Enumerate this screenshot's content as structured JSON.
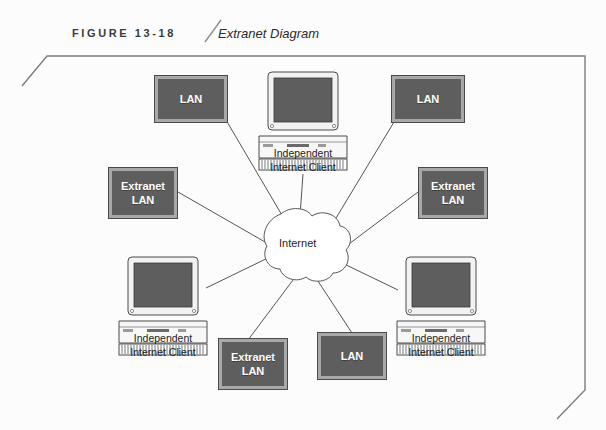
{
  "header": {
    "figure_label": "FIGURE 13-18",
    "title": "Extranet Diagram"
  },
  "diagram": {
    "center": {
      "name": "internet-cloud",
      "label": "Internet",
      "cx": 303,
      "cy": 243
    },
    "nodes": [
      {
        "id": "lan-top-left",
        "type": "lan-box",
        "label": "LAN",
        "lines": [
          "LAN"
        ],
        "x": 155,
        "y": 76,
        "w": 72,
        "h": 46
      },
      {
        "id": "client-top",
        "type": "computer",
        "label": "Independent Internet Client",
        "lines": [
          "Independent",
          "Internet Client"
        ],
        "x": 258,
        "y": 70,
        "w": 90,
        "h": 68
      },
      {
        "id": "lan-top-right",
        "type": "lan-box",
        "label": "LAN",
        "lines": [
          "LAN"
        ],
        "x": 392,
        "y": 76,
        "w": 72,
        "h": 46
      },
      {
        "id": "extranet-lan-left",
        "type": "lan-box",
        "label": "Extranet LAN",
        "lines": [
          "Extranet",
          "LAN"
        ],
        "x": 109,
        "y": 168,
        "w": 68,
        "h": 50
      },
      {
        "id": "extranet-lan-right",
        "type": "lan-box",
        "label": "Extranet LAN",
        "lines": [
          "Extranet",
          "LAN"
        ],
        "x": 419,
        "y": 168,
        "w": 68,
        "h": 50
      },
      {
        "id": "client-bottom-left",
        "type": "computer",
        "label": "Independent Internet Client",
        "lines": [
          "Independent",
          "Internet Client"
        ],
        "x": 118,
        "y": 255,
        "w": 90,
        "h": 68
      },
      {
        "id": "client-bottom-right",
        "type": "computer",
        "label": "Independent Internet Client",
        "lines": [
          "Independent",
          "Internet Client"
        ],
        "x": 396,
        "y": 255,
        "w": 90,
        "h": 68
      },
      {
        "id": "extranet-lan-bottom",
        "type": "lan-box",
        "label": "Extranet LAN",
        "lines": [
          "Extranet",
          "LAN"
        ],
        "x": 219,
        "y": 339,
        "w": 68,
        "h": 50
      },
      {
        "id": "lan-bottom",
        "type": "lan-box",
        "label": "LAN",
        "lines": [
          "LAN"
        ],
        "x": 318,
        "y": 333,
        "w": 68,
        "h": 46
      }
    ],
    "connections": [
      {
        "from": "lan-top-left",
        "to": "internet-cloud"
      },
      {
        "from": "client-top",
        "to": "internet-cloud"
      },
      {
        "from": "lan-top-right",
        "to": "internet-cloud"
      },
      {
        "from": "extranet-lan-left",
        "to": "internet-cloud"
      },
      {
        "from": "extranet-lan-right",
        "to": "internet-cloud"
      },
      {
        "from": "client-bottom-left",
        "to": "internet-cloud"
      },
      {
        "from": "client-bottom-right",
        "to": "internet-cloud"
      },
      {
        "from": "extranet-lan-bottom",
        "to": "internet-cloud"
      },
      {
        "from": "lan-bottom",
        "to": "internet-cloud"
      }
    ]
  },
  "colors": {
    "box_fill": "#5e5e5e",
    "box_border": "#a8a8a8",
    "box_outline": "#4a4a4a",
    "screen_fill": "#5e5e5e",
    "line": "#555555",
    "frame": "#7d7d7d",
    "text_dark": "#1d1d1d",
    "text_white": "#ffffff"
  }
}
